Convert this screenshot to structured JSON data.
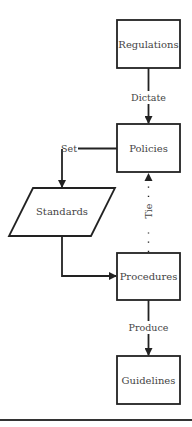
{
  "diagram": {
    "nodes": [
      {
        "id": "regulations",
        "label": "Regulations",
        "shape": "rectangle"
      },
      {
        "id": "policies",
        "label": "Policies",
        "shape": "rectangle"
      },
      {
        "id": "standards",
        "label": "Standards",
        "shape": "parallelogram"
      },
      {
        "id": "procedures",
        "label": "Procedures",
        "shape": "rectangle"
      },
      {
        "id": "guidelines",
        "label": "Guidelines",
        "shape": "rectangle"
      }
    ],
    "edges": [
      {
        "from": "regulations",
        "to": "policies",
        "label": "Dictate",
        "style": "solid"
      },
      {
        "from": "policies",
        "to": "standards",
        "label": "Set",
        "style": "solid"
      },
      {
        "from": "standards",
        "to": "procedures",
        "label": "",
        "style": "solid"
      },
      {
        "from": "procedures",
        "to": "policies",
        "label": "Tie",
        "style": "dotted"
      },
      {
        "from": "procedures",
        "to": "guidelines",
        "label": "Produce",
        "style": "solid"
      }
    ]
  },
  "colors": {
    "stroke": "#222222",
    "text": "#444444",
    "background": "#ffffff"
  }
}
